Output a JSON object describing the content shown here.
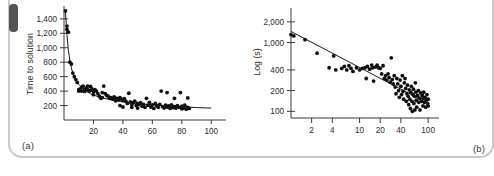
{
  "figure": {
    "frame_color": "#c9c9c9",
    "tab_color": "#555557",
    "background": "#ffffff",
    "point_color": "#101010",
    "axis_color": "#3a3a3a"
  },
  "panels": [
    {
      "tag": "(a)",
      "xlabel": "Number of problems",
      "ylabel": "Time to solution"
    },
    {
      "tag": "(b)",
      "xlabel": "Log (trials)",
      "ylabel": "Log (s)"
    }
  ],
  "chart_data": [
    {
      "type": "scatter",
      "title": "",
      "panel": "(a)",
      "xlabel": "Number of problems",
      "ylabel": "Time to solution",
      "xlim": [
        0,
        110
      ],
      "ylim": [
        0,
        1550
      ],
      "xticks": [
        20,
        40,
        60,
        80,
        100
      ],
      "xtick_labels": [
        "20",
        "40",
        "60",
        "80",
        "100"
      ],
      "yticks": [
        200,
        400,
        600,
        800,
        1000,
        1200,
        1400
      ],
      "ytick_labels": [
        "200",
        "400",
        "600",
        "800",
        "1,000",
        "1,200",
        "1,400"
      ],
      "grid": false,
      "legend": "none",
      "fit_curve": {
        "kind": "power-law",
        "description": "steep decay from ~1500 s at 1 problem flattening to ~150 s beyond 60 problems",
        "x": [
          1,
          2,
          3,
          4,
          5,
          6,
          7,
          8,
          10,
          12,
          15,
          18,
          22,
          26,
          30,
          35,
          40,
          45,
          50,
          55,
          60,
          70,
          80,
          90,
          100
        ],
        "y": [
          1500,
          1180,
          960,
          820,
          720,
          650,
          600,
          560,
          495,
          450,
          400,
          365,
          330,
          305,
          288,
          268,
          252,
          240,
          228,
          218,
          210,
          195,
          182,
          172,
          165
        ]
      },
      "points": [
        [
          1,
          1510
        ],
        [
          2,
          1300
        ],
        [
          2,
          1255
        ],
        [
          3,
          1215
        ],
        [
          4,
          800
        ],
        [
          5,
          775
        ],
        [
          6,
          650
        ],
        [
          7,
          600
        ],
        [
          8,
          560
        ],
        [
          9,
          520
        ],
        [
          10,
          420
        ],
        [
          10,
          400
        ],
        [
          11,
          430
        ],
        [
          12,
          455
        ],
        [
          12,
          400
        ],
        [
          13,
          470
        ],
        [
          14,
          420
        ],
        [
          14,
          395
        ],
        [
          15,
          440
        ],
        [
          16,
          470
        ],
        [
          16,
          420
        ],
        [
          17,
          400
        ],
        [
          18,
          465
        ],
        [
          18,
          410
        ],
        [
          19,
          430
        ],
        [
          20,
          395
        ],
        [
          20,
          350
        ],
        [
          21,
          420
        ],
        [
          22,
          400
        ],
        [
          23,
          365
        ],
        [
          24,
          330
        ],
        [
          25,
          300
        ],
        [
          26,
          380
        ],
        [
          26,
          310
        ],
        [
          27,
          470
        ],
        [
          28,
          365
        ],
        [
          29,
          340
        ],
        [
          30,
          330
        ],
        [
          31,
          300
        ],
        [
          32,
          310
        ],
        [
          33,
          290
        ],
        [
          34,
          320
        ],
        [
          35,
          300
        ],
        [
          35,
          265
        ],
        [
          36,
          300
        ],
        [
          37,
          280
        ],
        [
          38,
          310
        ],
        [
          38,
          200
        ],
        [
          39,
          290
        ],
        [
          40,
          270
        ],
        [
          40,
          180
        ],
        [
          41,
          295
        ],
        [
          42,
          260
        ],
        [
          43,
          230
        ],
        [
          44,
          370
        ],
        [
          45,
          250
        ],
        [
          46,
          215
        ],
        [
          46,
          175
        ],
        [
          47,
          240
        ],
        [
          48,
          260
        ],
        [
          49,
          200
        ],
        [
          50,
          230
        ],
        [
          50,
          165
        ],
        [
          51,
          215
        ],
        [
          52,
          240
        ],
        [
          53,
          190
        ],
        [
          54,
          215
        ],
        [
          55,
          175
        ],
        [
          56,
          300
        ],
        [
          57,
          205
        ],
        [
          58,
          245
        ],
        [
          59,
          180
        ],
        [
          60,
          210
        ],
        [
          61,
          160
        ],
        [
          62,
          230
        ],
        [
          63,
          195
        ],
        [
          64,
          175
        ],
        [
          65,
          215
        ],
        [
          66,
          400
        ],
        [
          67,
          185
        ],
        [
          68,
          165
        ],
        [
          69,
          205
        ],
        [
          70,
          380
        ],
        [
          70,
          180
        ],
        [
          71,
          195
        ],
        [
          72,
          160
        ],
        [
          73,
          210
        ],
        [
          74,
          170
        ],
        [
          75,
          300
        ],
        [
          75,
          185
        ],
        [
          76,
          165
        ],
        [
          77,
          200
        ],
        [
          78,
          175
        ],
        [
          79,
          380
        ],
        [
          80,
          155
        ],
        [
          80,
          190
        ],
        [
          81,
          165
        ],
        [
          82,
          205
        ],
        [
          83,
          150
        ],
        [
          84,
          305
        ],
        [
          84,
          175
        ],
        [
          85,
          160
        ]
      ]
    },
    {
      "type": "scatter",
      "title": "",
      "panel": "(b)",
      "xlabel": "Log (trials)",
      "ylabel": "Log (s)",
      "xscale": "log",
      "yscale": "log",
      "xlim": [
        1,
        110
      ],
      "ylim": [
        80,
        2600
      ],
      "xticks": [
        2,
        4,
        10,
        20,
        40,
        100
      ],
      "xtick_labels": [
        "2",
        "4",
        "10",
        "20",
        "40",
        "100"
      ],
      "yticks": [
        100,
        200,
        400,
        1000,
        2000
      ],
      "ytick_labels": [
        "100",
        "200",
        "400",
        "1,000",
        "2,000"
      ],
      "grid": false,
      "legend": "none",
      "fit_curve": {
        "kind": "log-log linear",
        "description": "straight line on log-log axes falling from ~1450 s at 1 trial to ~130 s at 100 trials",
        "x": [
          1,
          100
        ],
        "y": [
          1450,
          130
        ]
      },
      "points": [
        [
          1,
          1300
        ],
        [
          1.1,
          1250
        ],
        [
          1.6,
          1100
        ],
        [
          2.4,
          700
        ],
        [
          3.6,
          430
        ],
        [
          4.2,
          640
        ],
        [
          4.5,
          400
        ],
        [
          5.5,
          420
        ],
        [
          6,
          450
        ],
        [
          6.5,
          400
        ],
        [
          7,
          460
        ],
        [
          7.5,
          420
        ],
        [
          8,
          380
        ],
        [
          9,
          430
        ],
        [
          10,
          400
        ],
        [
          11,
          420
        ],
        [
          12,
          430
        ],
        [
          12.5,
          300
        ],
        [
          13,
          450
        ],
        [
          14,
          410
        ],
        [
          15,
          470
        ],
        [
          15.5,
          430
        ],
        [
          16,
          275
        ],
        [
          17,
          440
        ],
        [
          18,
          470
        ],
        [
          19,
          430
        ],
        [
          20,
          420
        ],
        [
          21,
          350
        ],
        [
          22,
          460
        ],
        [
          23,
          300
        ],
        [
          24,
          330
        ],
        [
          25,
          285
        ],
        [
          26,
          350
        ],
        [
          27,
          310
        ],
        [
          28,
          265
        ],
        [
          29,
          600
        ],
        [
          30,
          290
        ],
        [
          31,
          250
        ],
        [
          32,
          330
        ],
        [
          33,
          225
        ],
        [
          34,
          180
        ],
        [
          35,
          300
        ],
        [
          36,
          250
        ],
        [
          37,
          200
        ],
        [
          38,
          160
        ],
        [
          39,
          285
        ],
        [
          40,
          230
        ],
        [
          41,
          175
        ],
        [
          42,
          330
        ],
        [
          43,
          195
        ],
        [
          44,
          150
        ],
        [
          45,
          260
        ],
        [
          46,
          300
        ],
        [
          47,
          215
        ],
        [
          48,
          140
        ],
        [
          49,
          180
        ],
        [
          50,
          240
        ],
        [
          51,
          165
        ],
        [
          52,
          125
        ],
        [
          53,
          205
        ],
        [
          54,
          150
        ],
        [
          55,
          110
        ],
        [
          56,
          190
        ],
        [
          57,
          230
        ],
        [
          58,
          140
        ],
        [
          59,
          100
        ],
        [
          60,
          175
        ],
        [
          61,
          210
        ],
        [
          62,
          130
        ],
        [
          63,
          165
        ],
        [
          64,
          105
        ],
        [
          65,
          260
        ],
        [
          66,
          190
        ],
        [
          67,
          145
        ],
        [
          68,
          115
        ],
        [
          70,
          170
        ],
        [
          72,
          200
        ],
        [
          73,
          135
        ],
        [
          75,
          155
        ],
        [
          76,
          105
        ],
        [
          78,
          185
        ],
        [
          80,
          140
        ],
        [
          82,
          170
        ],
        [
          84,
          120
        ],
        [
          85,
          155
        ],
        [
          86,
          190
        ],
        [
          88,
          135
        ],
        [
          90,
          160
        ],
        [
          92,
          115
        ],
        [
          94,
          145
        ],
        [
          96,
          175
        ],
        [
          98,
          130
        ],
        [
          100,
          150
        ],
        [
          100,
          120
        ]
      ]
    }
  ]
}
